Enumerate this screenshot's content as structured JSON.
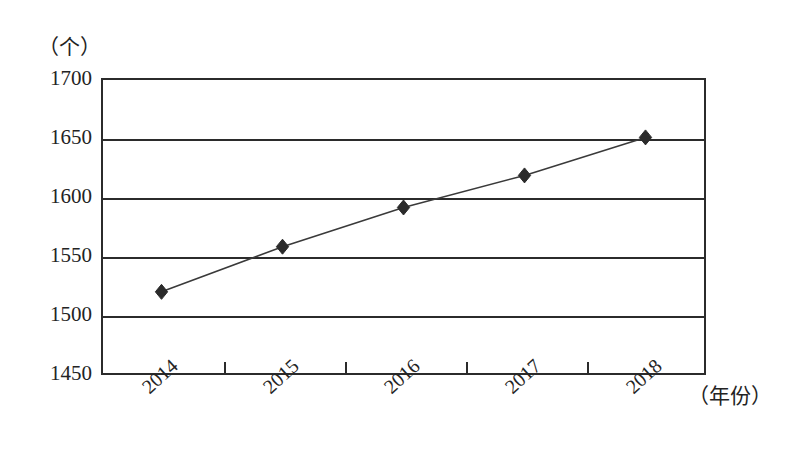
{
  "figure": {
    "y_unit_label": "（个）",
    "x_unit_label": "（年份）"
  },
  "chart_data": {
    "type": "line",
    "title": "",
    "subtitle": "",
    "xlabel": "（年份）",
    "ylabel": "（个）",
    "categories": [
      "2014",
      "2015",
      "2016",
      "2017",
      "2018"
    ],
    "values": [
      1520,
      1558,
      1591,
      1618,
      1650
    ],
    "series": [
      {
        "name": "数量",
        "values": [
          1520,
          1558,
          1591,
          1618,
          1650
        ]
      }
    ],
    "ylim": [
      1450,
      1700
    ],
    "yticks": [
      1450,
      1500,
      1550,
      1600,
      1650,
      1700
    ],
    "ytick_labels": [
      "1450",
      "1500",
      "1550",
      "1600",
      "1650",
      "1700"
    ],
    "xtick_labels": [
      "2014",
      "2015",
      "2016",
      "2017",
      "2018"
    ],
    "grid": true,
    "grid_axis": "y",
    "legend": false,
    "legend_position": "none",
    "marker": "diamond",
    "marker_color": "#2b2b2b",
    "line_color": "#3a3a3a",
    "line_width": 1.6,
    "axis_color": "#2b2b2b",
    "background": "#ffffff",
    "annotations": []
  },
  "axes": {
    "y_ticks": [
      {
        "label": "1700",
        "value": 1700
      },
      {
        "label": "1650",
        "value": 1650
      },
      {
        "label": "1600",
        "value": 1600
      },
      {
        "label": "1550",
        "value": 1550
      },
      {
        "label": "1500",
        "value": 1500
      },
      {
        "label": "1450",
        "value": 1450
      }
    ],
    "x_ticks": [
      {
        "label": "2014"
      },
      {
        "label": "2015"
      },
      {
        "label": "2016"
      },
      {
        "label": "2017"
      },
      {
        "label": "2018"
      }
    ]
  }
}
